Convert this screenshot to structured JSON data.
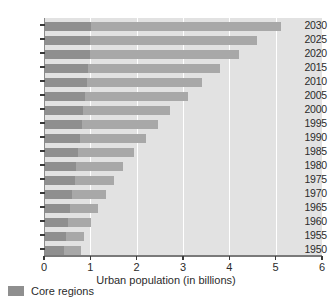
{
  "chart_data": {
    "type": "bar",
    "orientation": "horizontal",
    "stacked": true,
    "title": "",
    "xlabel": "Urban population (in billions)",
    "ylabel": "",
    "xlim": [
      0,
      6
    ],
    "ylim_categories_order": "descending-top",
    "grid": true,
    "gridlines_axis": "x",
    "legend_position": "below-left",
    "categories": [
      "2030",
      "2025",
      "2020",
      "2015",
      "2010",
      "2005",
      "2000",
      "1995",
      "1990",
      "1985",
      "1980",
      "1975",
      "1970",
      "1965",
      "1960",
      "1955",
      "1950"
    ],
    "xticks": [
      "0",
      "1",
      "2",
      "3",
      "4",
      "5",
      "6"
    ],
    "series": [
      {
        "name": "Core regions",
        "color": "#8f8f8f",
        "values": [
          1.01,
          1.0,
          0.99,
          0.96,
          0.92,
          0.89,
          0.85,
          0.82,
          0.78,
          0.74,
          0.7,
          0.66,
          0.61,
          0.56,
          0.51,
          0.47,
          0.44
        ]
      },
      {
        "name": "Other regions",
        "color": "#a8a8a8",
        "values": [
          4.11,
          3.6,
          3.21,
          2.83,
          2.5,
          2.22,
          1.86,
          1.65,
          1.42,
          1.21,
          1.01,
          0.86,
          0.72,
          0.61,
          0.51,
          0.4,
          0.35
        ]
      }
    ],
    "totals": [
      5.12,
      4.6,
      4.2,
      3.79,
      3.42,
      3.11,
      2.71,
      2.47,
      2.2,
      1.95,
      1.71,
      1.52,
      1.33,
      1.17,
      1.02,
      0.87,
      0.79
    ]
  },
  "legend": {
    "items": [
      {
        "label": "Core regions",
        "color": "#8f8f8f"
      }
    ]
  },
  "axis": {
    "x_title": "Urban population (in billions)"
  }
}
